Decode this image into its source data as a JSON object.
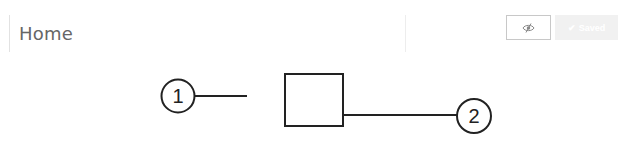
{
  "header": {
    "title": "Home",
    "visibility_button": {
      "icon": "eye-slash-icon",
      "state": "hidden"
    },
    "saved_button": {
      "icon": "check-icon",
      "label": "Saved",
      "check_glyph": "✔",
      "disabled": true
    }
  },
  "diagram": {
    "callouts": [
      {
        "label": "1",
        "target": "left-of-box"
      },
      {
        "label": "2",
        "target": "box-right-side"
      }
    ],
    "colors": {
      "stroke": "#222222"
    }
  }
}
